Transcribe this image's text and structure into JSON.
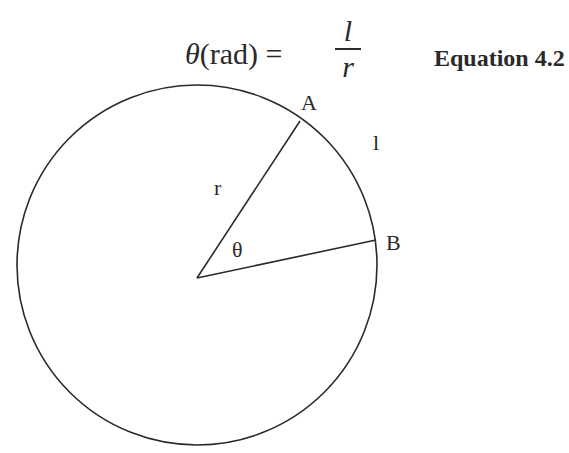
{
  "equation": {
    "lhs_symbol": "θ",
    "lhs_unit": "(rad)",
    "equals": "=",
    "numerator": "l",
    "denominator": "r",
    "label": "Equation 4.2"
  },
  "diagram": {
    "labels": {
      "point_a": "A",
      "point_b": "B",
      "arc_length": "l",
      "radius": "r",
      "angle": "θ"
    },
    "circle": {
      "cx": 197,
      "cy": 277,
      "r": 180
    },
    "point_a": {
      "x": 300,
      "y": 121
    },
    "point_b": {
      "x": 376,
      "y": 240
    },
    "stroke_color": "#2a2a2a"
  }
}
